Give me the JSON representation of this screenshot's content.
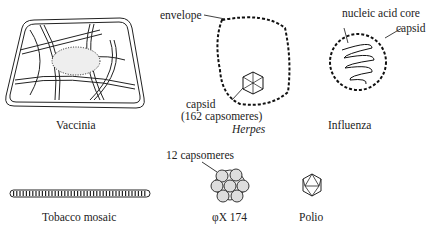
{
  "figure": {
    "viruses": [
      {
        "name": "Vaccinia",
        "italic": false
      },
      {
        "name": "Herpes",
        "italic": true,
        "annotations": [
          "envelope",
          "capsid",
          "(162 capsomeres)"
        ]
      },
      {
        "name": "Influenza",
        "italic": false,
        "annotations": [
          "nucleic acid core",
          "capsid"
        ]
      },
      {
        "name": "Tobacco mosaic",
        "italic": false
      },
      {
        "name": "φX 174",
        "italic": false,
        "annotations": [
          "12 capsomeres"
        ]
      },
      {
        "name": "Polio",
        "italic": false
      }
    ]
  }
}
